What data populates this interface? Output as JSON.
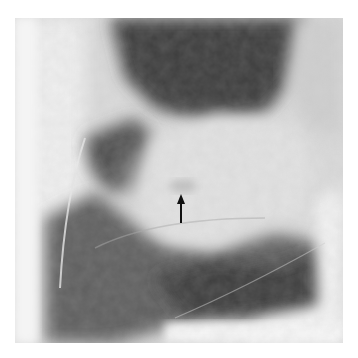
{
  "image": {
    "kind": "radiograph",
    "modality": "grayscale x-ray",
    "annotation": {
      "type": "arrow",
      "direction": "up",
      "color": "#111111",
      "tip": [
        181,
        195
      ],
      "tail": [
        181,
        223
      ]
    },
    "colors": {
      "background": "#ffffff",
      "dark_region": "#3e3e3e",
      "mid_region": "#7a7a7a",
      "bright_region": "#e6e6e6"
    }
  }
}
